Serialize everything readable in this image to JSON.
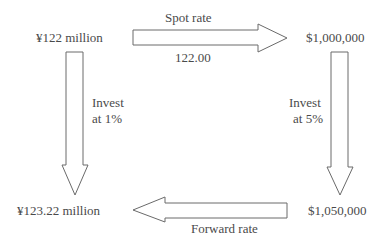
{
  "nodes": {
    "top_left": "¥122 million",
    "top_right": "$1,000,000",
    "bottom_left": "¥123.22 million",
    "bottom_right": "$1,050,000"
  },
  "arrows": {
    "top": {
      "label_above": "Spot rate",
      "label_below": "122.00"
    },
    "left": {
      "label_line1": "Invest",
      "label_line2": "at 1%"
    },
    "right": {
      "label_line1": "Invest",
      "label_line2": "at 5%"
    },
    "bottom": {
      "label_below": "Forward rate"
    }
  },
  "colors": {
    "stroke": "#6a6a6a",
    "text": "#4a4a4a"
  }
}
